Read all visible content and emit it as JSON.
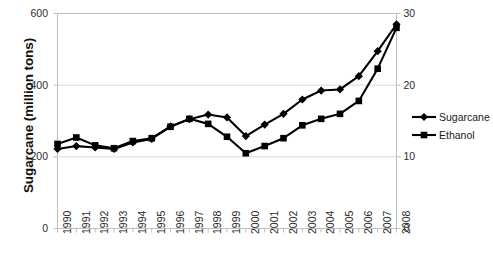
{
  "chart_data": {
    "type": "line",
    "title": "",
    "xlabel": "",
    "ylabel": "Sugarcane (million tons)",
    "ylabel_right": "",
    "categories": [
      "1990",
      "1991",
      "1992",
      "1993",
      "1994",
      "1995",
      "1996",
      "1997",
      "1998",
      "1999",
      "2000",
      "2001",
      "2002",
      "2003",
      "2004",
      "2005",
      "2006",
      "2007",
      "2008"
    ],
    "ylim": [
      0,
      600
    ],
    "yticks": [
      "0",
      "200",
      "400",
      "600"
    ],
    "ylim_right": [
      0,
      30
    ],
    "yticks_right": [
      "0",
      "10",
      "20",
      "30"
    ],
    "grid": true,
    "legend_position": "right",
    "series": [
      {
        "name": "Sugarcane",
        "axis": "left",
        "marker": "diamond",
        "values": [
          222,
          230,
          226,
          222,
          240,
          250,
          285,
          305,
          318,
          310,
          258,
          290,
          320,
          360,
          385,
          388,
          425,
          495,
          570
        ]
      },
      {
        "name": "Ethanol",
        "axis": "right",
        "marker": "square",
        "values": [
          11.8,
          12.7,
          11.6,
          11.2,
          12.2,
          12.6,
          14.2,
          15.3,
          14.6,
          12.8,
          10.5,
          11.5,
          12.6,
          14.4,
          15.3,
          16.0,
          17.8,
          22.3,
          28.0
        ]
      }
    ]
  },
  "legend": {
    "items": [
      {
        "label": "Sugarcane",
        "marker": "diamond"
      },
      {
        "label": "Ethanol",
        "marker": "square"
      }
    ]
  },
  "colors": {
    "series": "#000000",
    "grid": "#d9d9d9",
    "axis": "#bfbfbf",
    "text": "#2b2b2b"
  }
}
